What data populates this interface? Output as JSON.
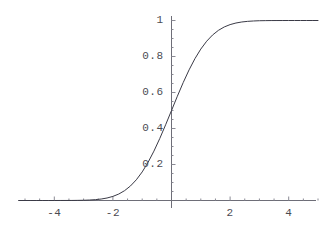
{
  "chart_data": {
    "type": "line",
    "title": "",
    "subtitle": "",
    "xlabel": "",
    "ylabel": "",
    "xlim": [
      -5.2,
      5.0
    ],
    "ylim": [
      0,
      1.02
    ],
    "grid": false,
    "legend": null,
    "axis_style": "mathematica-crossed-axes",
    "line_color": "#3a3a46",
    "line_width": 1,
    "x_ticks": [
      -4,
      -2,
      2,
      4
    ],
    "x_tick_labels": [
      "-4",
      "-2",
      "2",
      "4"
    ],
    "x_minor_tick_step": 0.5,
    "y_ticks": [
      0.2,
      0.4,
      0.6,
      0.8,
      1
    ],
    "y_tick_labels": [
      "0.2",
      "0.4",
      "0.6",
      "0.8",
      "1"
    ],
    "y_minor_tick_step": 0.05,
    "series": [
      {
        "name": "normal CDF",
        "x": [
          -5.2,
          -5.0,
          -4.8,
          -4.6,
          -4.4,
          -4.2,
          -4.0,
          -3.8,
          -3.6,
          -3.4,
          -3.2,
          -3.0,
          -2.8,
          -2.6,
          -2.4,
          -2.2,
          -2.0,
          -1.8,
          -1.6,
          -1.4,
          -1.2,
          -1.0,
          -0.8,
          -0.6,
          -0.4,
          -0.2,
          0.0,
          0.2,
          0.4,
          0.6,
          0.8,
          1.0,
          1.2,
          1.4,
          1.6,
          1.8,
          2.0,
          2.2,
          2.4,
          2.6,
          2.8,
          3.0,
          3.2,
          3.4,
          3.6,
          3.8,
          4.0,
          4.2,
          4.4,
          4.6,
          4.8,
          5.0
        ],
        "y": [
          0.0,
          0.0,
          0.0,
          0.0,
          0.0,
          0.0,
          0.0,
          0.0001,
          0.0002,
          0.0003,
          0.0007,
          0.0013,
          0.0026,
          0.0047,
          0.0082,
          0.0139,
          0.0228,
          0.0359,
          0.0548,
          0.0808,
          0.1151,
          0.1587,
          0.2119,
          0.2743,
          0.3446,
          0.4207,
          0.5,
          0.5793,
          0.6554,
          0.7257,
          0.7881,
          0.8413,
          0.8849,
          0.9192,
          0.9452,
          0.9641,
          0.9772,
          0.9861,
          0.9918,
          0.9953,
          0.9974,
          0.9987,
          0.9993,
          0.9997,
          0.9998,
          0.9999,
          1.0,
          1.0,
          1.0,
          1.0,
          1.0,
          1.0
        ]
      }
    ]
  },
  "axes": {
    "y_axis_x_value": 0,
    "x_axis_y_value": 0
  }
}
